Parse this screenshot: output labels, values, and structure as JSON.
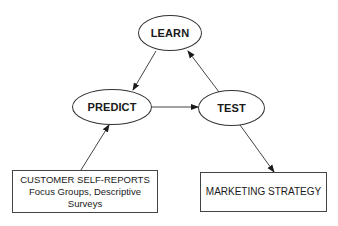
{
  "diagram": {
    "type": "flow-cycle",
    "nodes": {
      "learn": {
        "label": "LEARN",
        "shape": "ellipse"
      },
      "predict": {
        "label": "PREDICT",
        "shape": "ellipse"
      },
      "test": {
        "label": "TEST",
        "shape": "ellipse"
      },
      "customer": {
        "shape": "rectangle",
        "lines": [
          "CUSTOMER SELF-REPORTS",
          "Focus Groups, Descriptive",
          "Surveys"
        ]
      },
      "marketing": {
        "shape": "rectangle",
        "lines": [
          "MARKETING STRATEGY"
        ]
      }
    },
    "edges": [
      {
        "from": "learn",
        "to": "predict"
      },
      {
        "from": "predict",
        "to": "test"
      },
      {
        "from": "test",
        "to": "learn"
      },
      {
        "from": "customer",
        "to": "predict"
      },
      {
        "from": "test",
        "to": "marketing"
      }
    ],
    "colors": {
      "stroke": "#333333",
      "background": "#ffffff",
      "text": "#1a1a1a"
    }
  }
}
